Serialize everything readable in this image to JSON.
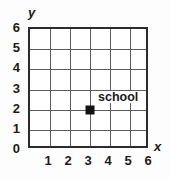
{
  "chart_data": {
    "type": "scatter",
    "title": "",
    "xlabel": "x",
    "ylabel": "y",
    "xlim": [
      0,
      6
    ],
    "ylim": [
      0,
      6
    ],
    "grid": true,
    "legend": false,
    "xticks": [
      "1",
      "2",
      "3",
      "4",
      "5",
      "6"
    ],
    "xtick_values": [
      1,
      2,
      3,
      4,
      5,
      6
    ],
    "yticks": [
      "0",
      "1",
      "2",
      "3",
      "4",
      "5",
      "6"
    ],
    "ytick_values": [
      0,
      1,
      2,
      3,
      4,
      5,
      6
    ],
    "origin_label": "0",
    "points": [
      {
        "label": "school",
        "x": 3,
        "y": 2,
        "marker": "square",
        "color": "#131313"
      }
    ]
  },
  "axes": {
    "x_letter": "x",
    "y_letter": "y"
  }
}
